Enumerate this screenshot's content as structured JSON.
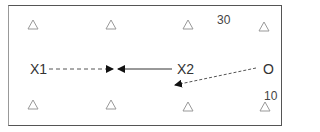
{
  "diagram": {
    "nodes": [
      {
        "id": "x1",
        "label": "X1"
      },
      {
        "id": "x2",
        "label": "X2"
      },
      {
        "id": "o",
        "label": "O"
      }
    ],
    "annotations": {
      "top_right": "30",
      "bottom_right": "10"
    },
    "markers": {
      "count_top": 4,
      "count_bottom": 4,
      "glyph": "triangle-outline"
    },
    "edges": [
      {
        "from": "x1",
        "to": "mid",
        "style": "dashed"
      },
      {
        "from": "x2",
        "to": "mid",
        "style": "solid"
      },
      {
        "from": "o",
        "to": "below-x2",
        "style": "dashed"
      }
    ],
    "colors": {
      "stroke": "#333333",
      "marker": "#999999",
      "frame": "#555555"
    }
  }
}
